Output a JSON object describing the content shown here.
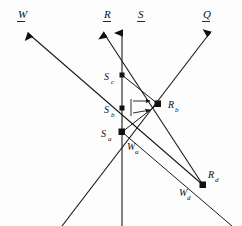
{
  "figure": {
    "background_color": "#fdfdfd",
    "ink_color": "#111111",
    "width": 242,
    "height": 226
  },
  "axis_labels": [
    {
      "id": "W",
      "text": "W",
      "underlined": true,
      "x": 18,
      "y": 18,
      "direction": "up-left"
    },
    {
      "id": "R",
      "text": "R",
      "underlined": true,
      "x": 104,
      "y": 18,
      "direction": "up-left"
    },
    {
      "id": "S",
      "text": "S",
      "underlined": true,
      "x": 138,
      "y": 18,
      "direction": "up"
    },
    {
      "id": "Q",
      "text": "Q",
      "underlined": true,
      "x": 203,
      "y": 18,
      "direction": "up-right"
    }
  ],
  "nodes": [
    {
      "id": "Sc",
      "base": "S",
      "sub": "c",
      "x": 122,
      "y": 75,
      "label_x": 104,
      "label_y": 80
    },
    {
      "id": "Sb",
      "base": "S",
      "sub": "b",
      "x": 122,
      "y": 108,
      "label_x": 104,
      "label_y": 113
    },
    {
      "id": "Sa",
      "base": "S",
      "sub": "a",
      "x": 122,
      "y": 132,
      "label_x": 102,
      "label_y": 137
    },
    {
      "id": "Rb",
      "base": "R",
      "sub": "b",
      "x": 158,
      "y": 104,
      "label_x": 168,
      "label_y": 108
    },
    {
      "id": "Wa",
      "base": "W",
      "sub": "a",
      "x": 122,
      "y": 132,
      "label_x": 128,
      "label_y": 150
    },
    {
      "id": "Rd",
      "base": "R",
      "sub": "d",
      "x": 203,
      "y": 185,
      "label_x": 208,
      "label_y": 178
    },
    {
      "id": "Wd",
      "base": "W",
      "sub": "d",
      "x": 203,
      "y": 185,
      "label_x": 180,
      "label_y": 195
    }
  ],
  "dimension_marks": {
    "id": "Sb-to-Rb",
    "description": "double arrow pair from S axis to Rb node"
  },
  "rays": [
    {
      "id": "ray-W",
      "from": "bottom-right",
      "to": "top-left",
      "arrowhead": "top-left"
    },
    {
      "id": "ray-R",
      "from": "bottom-right",
      "to": "top-left",
      "arrowhead": "top-left"
    },
    {
      "id": "ray-S",
      "from": "bottom",
      "to": "top",
      "arrowhead": "top"
    },
    {
      "id": "ray-Q",
      "from": "bottom-left",
      "to": "top-right",
      "arrowhead": "top-right"
    }
  ]
}
